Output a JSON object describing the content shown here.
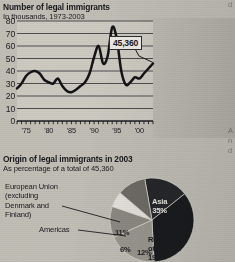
{
  "line_section": {
    "title": "Number of legal immigrants",
    "subtitle": "In thousands, 1973-2003",
    "callout": "45,360"
  },
  "pie_section": {
    "title": "Origin of legal immigrants in 2003",
    "subtitle": "As percentage of a total of 45,360",
    "annotation_eu": "European Union\n(excluding\nDenmark and\nFinland)",
    "annotation_americas": "Americas"
  },
  "edge_fragments": {
    "right_mid": "A\nn\nd",
    "right_top": "d"
  },
  "chart_data": [
    {
      "type": "line",
      "title": "Number of legal immigrants",
      "subtitle": "In thousands, 1973-2003",
      "xlabel": "",
      "ylabel": "In thousands",
      "ylim": [
        0,
        80
      ],
      "yticks": [
        0,
        10,
        20,
        30,
        40,
        50,
        60,
        70,
        80
      ],
      "xlim": [
        1973,
        2003
      ],
      "xticks": [
        1975,
        1980,
        1985,
        1990,
        1995,
        2000
      ],
      "xticklabels": [
        "'75",
        "'80",
        "'85",
        "'90",
        "'95",
        "'00"
      ],
      "grid": true,
      "legend": "none",
      "annotations": [
        {
          "text": "45,360",
          "x": 2003,
          "y": 46
        }
      ],
      "x": [
        1973,
        1974,
        1975,
        1976,
        1977,
        1978,
        1979,
        1980,
        1981,
        1982,
        1983,
        1984,
        1985,
        1986,
        1987,
        1988,
        1989,
        1990,
        1991,
        1992,
        1993,
        1994,
        1995,
        1996,
        1997,
        1998,
        1999,
        2000,
        2001,
        2002,
        2003
      ],
      "values": [
        26,
        30,
        36,
        39,
        40,
        38,
        33,
        31,
        30,
        34,
        28,
        24,
        23,
        25,
        28,
        31,
        38,
        51,
        60,
        46,
        52,
        75,
        66,
        40,
        29,
        31,
        35,
        34,
        38,
        42,
        46
      ],
      "units": "thousands"
    },
    {
      "type": "pie",
      "title": "Origin of legal immigrants in 2003",
      "subtitle": "As percentage of a total of 45,360",
      "total": "45,360",
      "labels": [
        "Asia",
        "Rest of Europe",
        "12%",
        "6%",
        "European Union (excluding Denmark and Finland)",
        "Americas"
      ],
      "slices": [
        {
          "name": "Asia",
          "label": "Asia\n35%",
          "value": 35,
          "color": "#17181b",
          "text_color": "#ecebe7"
        },
        {
          "name": "Rest of Europe",
          "label": "Rest\nof Europe\n19%",
          "value": 19,
          "color": "#9b9890",
          "text_color": "#1b1b1d"
        },
        {
          "name": "Unlabelled",
          "label": "12%",
          "value": 12,
          "color": "#8d8a83",
          "text_color": "#1b1b1d"
        },
        {
          "name": "Americas",
          "label": "6%",
          "value": 6,
          "color": "#e8e6e0",
          "text_color": "#1b1b1d"
        },
        {
          "name": "European Union",
          "label": "11%",
          "value": 11,
          "color": "#6e6b66",
          "text_color": "#1b1b1d"
        },
        {
          "name": "Other",
          "label": "",
          "value": 17,
          "color": "#232427",
          "text_color": "#ecebe7"
        }
      ]
    }
  ]
}
